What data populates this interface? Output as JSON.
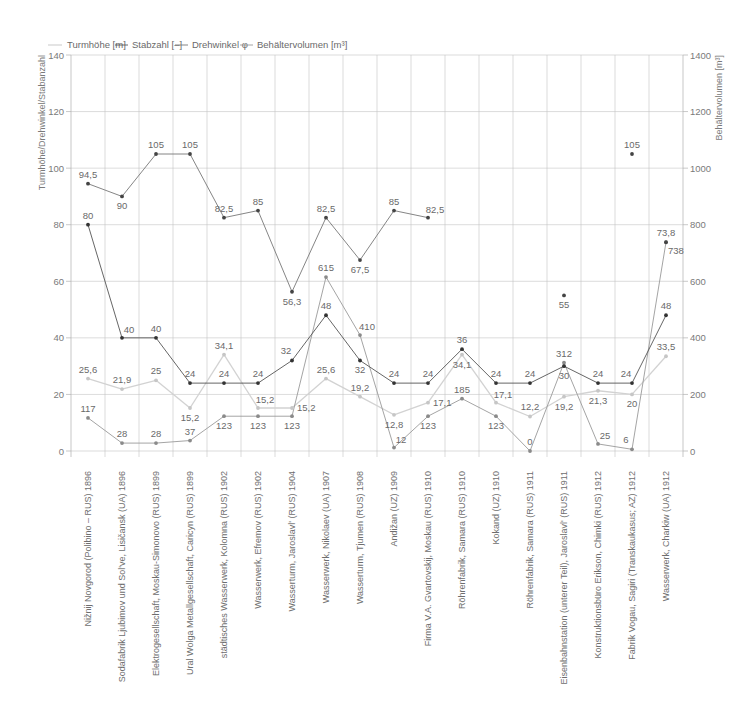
{
  "chart_data": {
    "type": "line",
    "title": "",
    "xlabel": "",
    "ylabel": "Turmhöhe/Drehwinkel/Stabanzahl",
    "y2label": "Behältervolumen [m³]",
    "ylim": [
      0,
      140
    ],
    "y2lim": [
      0,
      1400
    ],
    "yticks": [
      0,
      20,
      40,
      60,
      80,
      100,
      120,
      140
    ],
    "y2ticks": [
      0,
      200,
      400,
      600,
      800,
      1000,
      1200,
      1400
    ],
    "grid": true,
    "legend_position": "top-left",
    "categories": [
      "Nižnij Novgorod (Polibino – RUS) 1896",
      "Sodafabrik Ljubimov und Sol've,  Lisičansk (UA) 1896",
      "Elektrogesellschaft, Moskau-Simonovo (RUS) 1899",
      "Ural Wolga Metallgesellschaft, Caricyn (RUS) 1899",
      "städtisches Wasserwerk, Kolomna (RUS) 1902",
      "Wasserwerk, Efremov (RUS) 1902",
      "Wasserturm, Jaroslavl' (RUS) 1904",
      "Wasserwerk, Nikolaev (UA) 1907",
      "Wasserturm, Tjumen (RUS) 1908",
      "Andižan (UZ) 1909",
      "Firma V.A. Gvartovskij, Moskau (RUS) 1910",
      "Röhrenfabrik, Samara (RUS) 1910",
      "Kokand (UZ) 1910",
      "Röhrenfabrik, Samara (RUS) 1911",
      "Eisenbahnstation (unterer Teil), Jaroslavl' (RUS) 1911",
      "Konstruktionsbüro Erikson, Chimki (RUS) 1912",
      "Fabrik Vogau, Sagiri (Transkaukasus; AZ) 1912",
      "Wasserwerk, Charkiw (UA) 1912"
    ],
    "series": [
      {
        "name": "Turmhöhe [m]",
        "axis": "left",
        "color": "#d2d2d2",
        "marker_color": "#c6c6c6",
        "values": [
          25.6,
          21.9,
          25,
          15.2,
          34.1,
          15.2,
          15.2,
          25.6,
          19.2,
          12.8,
          17.1,
          34.1,
          17.1,
          12.2,
          19.2,
          21.3,
          20,
          33.5
        ],
        "labels": [
          "25,6",
          "21,9",
          "25",
          "15,2",
          "34,1",
          "15,2",
          "15,2",
          "25,6",
          "19,2",
          "12,8",
          "17,1",
          "34,1",
          "17,1",
          "12,2",
          "19,2",
          "21,3",
          "20",
          "33,5"
        ],
        "line_breaks_after": []
      },
      {
        "name": "Stabzahl [–]",
        "axis": "left",
        "color": "#555555",
        "marker_color": "#333333",
        "values": [
          80,
          40,
          40,
          24,
          24,
          24,
          32,
          48,
          32,
          24,
          24,
          36,
          24,
          24,
          30,
          24,
          24,
          48
        ],
        "labels": [
          "80",
          "40",
          "40",
          "24",
          "24",
          "24",
          "32",
          "48",
          "32",
          "24",
          "24",
          "36",
          "24",
          "24",
          "30",
          "24",
          "24",
          "48"
        ],
        "line_breaks_after": []
      },
      {
        "name": "Drehwinkel φ",
        "axis": "left",
        "color": "#777777",
        "marker_color": "#444444",
        "values": [
          94.5,
          90,
          105,
          105,
          82.5,
          85,
          56.3,
          82.5,
          67.5,
          85,
          82.5,
          null,
          null,
          null,
          55,
          null,
          105,
          73.8
        ],
        "labels": [
          "94,5",
          "90",
          "105",
          "105",
          "82,5",
          "85",
          "56,3",
          "82,5",
          "67,5",
          "85",
          "82,5",
          null,
          null,
          null,
          "55",
          null,
          "105",
          "73,8"
        ],
        "line_breaks_after": [
          16
        ]
      },
      {
        "name": "Behältervolumen [m³]",
        "axis": "right",
        "color": "#9a9a9a",
        "marker_color": "#8a8a8a",
        "values": [
          117,
          28,
          28,
          37,
          123,
          123,
          123,
          615,
          410,
          12,
          123,
          185,
          123,
          0,
          312,
          25,
          6,
          738
        ],
        "labels": [
          "117",
          "28",
          "28",
          "37",
          "123",
          "123",
          "123",
          "615",
          "410",
          "12",
          "123",
          "185",
          "123",
          "0",
          "312",
          "25",
          "6",
          "738"
        ],
        "line_breaks_after": []
      }
    ]
  }
}
